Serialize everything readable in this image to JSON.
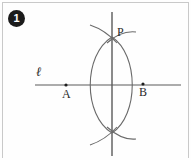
{
  "figure": {
    "step_number": "1",
    "caption": "",
    "background_color": "#fefefe",
    "stroke_color": "#555555",
    "frame_color": "#c9c9c9",
    "badge_color": "#1b1b1b",
    "labels": {
      "line_l": "ℓ",
      "point_a": "A",
      "point_b": "B",
      "point_p": "P"
    },
    "points": [
      {
        "name": "A",
        "x": 66,
        "y": 85
      },
      {
        "name": "B",
        "x": 143,
        "y": 84
      },
      {
        "name": "P",
        "x": 112,
        "y": 37
      }
    ],
    "elements": [
      {
        "name": "line-l",
        "type": "horizontal-line",
        "x1": 35,
        "y1": 85,
        "x2": 181,
        "y2": 85
      },
      {
        "name": "perpendicular-line",
        "type": "vertical-line",
        "x1": 112,
        "y1": 12,
        "x2": 112,
        "y2": 156
      },
      {
        "name": "arc-from-a",
        "type": "arc",
        "center": "A",
        "radius": 55
      },
      {
        "name": "arc-from-b",
        "type": "arc",
        "center": "B",
        "radius": 55
      },
      {
        "name": "intersection-top",
        "type": "point",
        "x": 112,
        "y": 37
      },
      {
        "name": "intersection-bottom",
        "type": "point",
        "x": 112,
        "y": 133
      }
    ]
  }
}
